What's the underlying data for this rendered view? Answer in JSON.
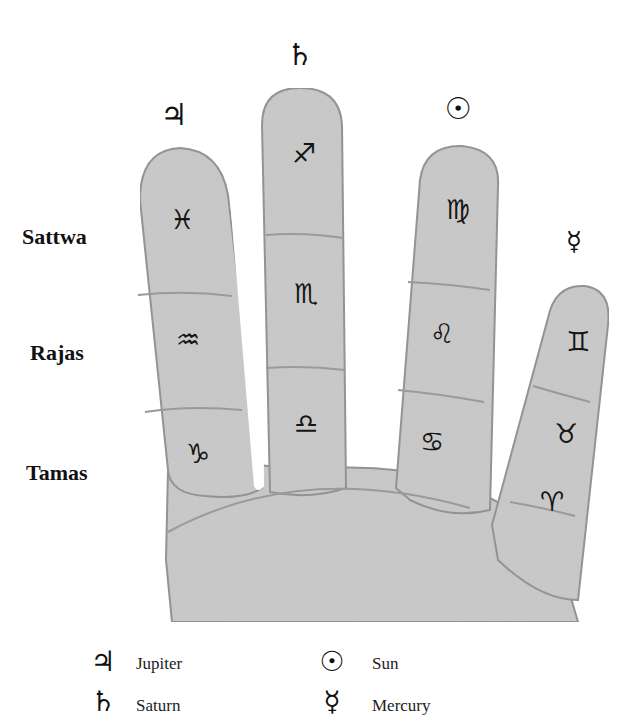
{
  "diagram": {
    "gunas": [
      {
        "label": "Sattwa"
      },
      {
        "label": "Rajas"
      },
      {
        "label": "Tamas"
      }
    ],
    "fingers": [
      {
        "name": "index",
        "planet": {
          "name": "Jupiter",
          "glyph": "♃"
        },
        "signs": [
          {
            "name": "Pisces",
            "glyph": "♓"
          },
          {
            "name": "Aquarius",
            "glyph": "♒"
          },
          {
            "name": "Capricorn",
            "glyph": "♑"
          }
        ]
      },
      {
        "name": "middle",
        "planet": {
          "name": "Saturn",
          "glyph": "♄"
        },
        "signs": [
          {
            "name": "Sagittarius",
            "glyph": "♐"
          },
          {
            "name": "Scorpio",
            "glyph": "♏"
          },
          {
            "name": "Libra",
            "glyph": "♎"
          }
        ]
      },
      {
        "name": "ring",
        "planet": {
          "name": "Sun",
          "glyph": "☉"
        },
        "signs": [
          {
            "name": "Virgo",
            "glyph": "♍"
          },
          {
            "name": "Leo",
            "glyph": "♌"
          },
          {
            "name": "Cancer",
            "glyph": "♋"
          }
        ]
      },
      {
        "name": "little",
        "planet": {
          "name": "Mercury",
          "glyph": "☿"
        },
        "signs": [
          {
            "name": "Gemini",
            "glyph": "♊"
          },
          {
            "name": "Taurus",
            "glyph": "♉"
          },
          {
            "name": "Aries",
            "glyph": "♈"
          }
        ]
      }
    ]
  },
  "legend": [
    {
      "glyph": "♃",
      "label": "Jupiter"
    },
    {
      "glyph": "♄",
      "label": "Saturn"
    },
    {
      "glyph": "☉",
      "label": "Sun"
    },
    {
      "glyph": "☿",
      "label": "Mercury"
    }
  ],
  "colors": {
    "hand_fill": "#c9c9c9",
    "hand_edge": "#8a8a8a",
    "crease": "#a0a0a0",
    "ink": "#111111"
  }
}
